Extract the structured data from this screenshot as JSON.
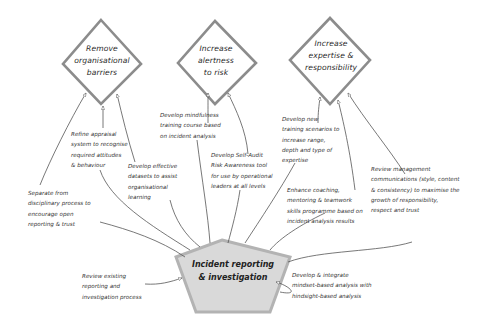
{
  "diagram": {
    "center": {
      "lines": [
        "Incident reporting",
        "& investigation"
      ],
      "fill": "#d9d9d9",
      "stroke": "#b3b3b3"
    },
    "goals": [
      {
        "id": "remove-barriers",
        "lines": [
          "Remove",
          "organisational",
          "barriers"
        ]
      },
      {
        "id": "increase-alertness",
        "lines": [
          "Increase",
          "alertness",
          "to risk"
        ]
      },
      {
        "id": "increase-expertise",
        "lines": [
          "Increase",
          "expertise &",
          "responsibility"
        ]
      }
    ],
    "goal_stroke": "#8c8c8c",
    "actions": [
      {
        "id": "refine-appraisal",
        "lines": [
          "Refine appraisal",
          "system to recognise",
          "required attitudes",
          "& behaviour"
        ]
      },
      {
        "id": "develop-datasets",
        "lines": [
          "Develop effective",
          "datasets to assist",
          "organisational",
          "learning"
        ]
      },
      {
        "id": "separate-disciplinary",
        "lines": [
          "Separate from",
          "disciplinary process to",
          "encourage open",
          "reporting & trust"
        ]
      },
      {
        "id": "develop-mindfulness",
        "lines": [
          "Develop mindfulness",
          "training course based",
          "on incident analysis"
        ]
      },
      {
        "id": "develop-self-audit",
        "lines": [
          "Develop Self-Audit",
          "Risk Awareness tool",
          "for use by operational",
          "leaders at all levels"
        ]
      },
      {
        "id": "develop-training-scenarios",
        "lines": [
          "Develop new",
          "training scenarios to",
          "increase range,",
          "depth and type of",
          "expertise"
        ]
      },
      {
        "id": "enhance-coaching",
        "lines": [
          "Enhance coaching,",
          "mentoring & teamwork",
          "skills programme based on",
          "incident analysis results"
        ]
      },
      {
        "id": "review-management-comms",
        "lines": [
          "Review management",
          "communications (style, content",
          "& consistency) to maximise the",
          "growth of responsibility,",
          "respect and trust"
        ]
      },
      {
        "id": "review-existing-process",
        "lines": [
          "Review existing",
          "reporting and",
          "investigation process"
        ]
      },
      {
        "id": "develop-mindset-analysis",
        "lines": [
          "Develop & integrate",
          "mindset-based analysis with",
          "hindsight-based analysis"
        ]
      }
    ],
    "connector_color": "#555555"
  }
}
